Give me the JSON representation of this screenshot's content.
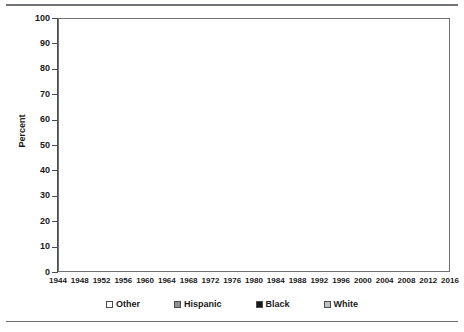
{
  "chart_data": {
    "type": "area",
    "stacked": true,
    "title": "",
    "subtitle": "",
    "xlabel": "",
    "ylabel": "Percent",
    "ylim": [
      0,
      100
    ],
    "ytick_step": 10,
    "yticks": [
      0,
      10,
      20,
      30,
      40,
      50,
      60,
      70,
      80,
      90,
      100
    ],
    "xlim": [
      1944,
      2016
    ],
    "grid": false,
    "legend_position": "bottom",
    "categories": [
      1944,
      1948,
      1952,
      1956,
      1960,
      1964,
      1968,
      1972,
      1976,
      1980,
      1984,
      1988,
      1992,
      1996,
      2000,
      2004,
      2008,
      2012,
      2016
    ],
    "xtick_labels": [
      "1944",
      "1948",
      "1952",
      "1956",
      "1960",
      "1964",
      "1968",
      "1972",
      "1976",
      "1980",
      "1984",
      "1988",
      "1992",
      "1996",
      "2000",
      "2004",
      "2008",
      "2012",
      "2016"
    ],
    "series": [
      {
        "name": "White",
        "color": "#c0c0c0",
        "stack_order": 1,
        "values": [
          88.5,
          88.3,
          88.0,
          87.6,
          87.2,
          86.6,
          85.8,
          84.8,
          83.6,
          82.2,
          80.3,
          78.2,
          75.8,
          73.0,
          70.0,
          66.8,
          63.2,
          58.0,
          50.0
        ]
      },
      {
        "name": "Black",
        "color": "#191919",
        "stack_order": 2,
        "values": [
          5.0,
          5.2,
          5.4,
          5.6,
          5.9,
          6.2,
          6.6,
          7.0,
          7.4,
          7.8,
          8.4,
          8.8,
          9.3,
          9.7,
          10.2,
          10.8,
          11.6,
          13.0,
          16.0
        ]
      },
      {
        "name": "Hispanic",
        "color": "#8f8f8f",
        "stack_order": 3,
        "values": [
          3.0,
          3.1,
          3.2,
          3.3,
          3.5,
          3.7,
          4.0,
          4.4,
          4.8,
          5.3,
          6.1,
          7.0,
          8.2,
          9.6,
          11.3,
          13.2,
          15.4,
          19.0,
          27.5
        ]
      },
      {
        "name": "Other",
        "color": "#ffffff",
        "stack_order": 4,
        "values": [
          3.5,
          3.4,
          3.4,
          3.5,
          3.4,
          3.5,
          3.6,
          3.8,
          4.2,
          4.7,
          5.2,
          6.0,
          6.7,
          7.7,
          8.5,
          9.2,
          9.8,
          10.0,
          6.5
        ]
      }
    ],
    "cumulative_tops": {
      "White": [
        88.5,
        88.3,
        88.0,
        87.6,
        87.2,
        86.6,
        85.8,
        84.8,
        83.6,
        82.2,
        80.3,
        78.2,
        75.8,
        73.0,
        70.0,
        66.8,
        63.2,
        58.0,
        50.0
      ],
      "Black": [
        93.5,
        93.5,
        93.4,
        93.2,
        93.1,
        92.8,
        92.4,
        91.8,
        91.0,
        90.0,
        88.7,
        87.0,
        85.1,
        82.7,
        80.2,
        77.6,
        74.8,
        71.0,
        66.0
      ],
      "Hispanic": [
        96.5,
        96.6,
        96.6,
        96.5,
        96.6,
        96.5,
        96.4,
        96.2,
        95.8,
        95.3,
        94.8,
        94.0,
        93.3,
        92.3,
        91.5,
        90.8,
        90.2,
        90.0,
        93.5
      ],
      "Other": [
        100,
        100,
        100,
        100,
        100,
        100,
        100,
        100,
        100,
        100,
        100,
        100,
        100,
        100,
        100,
        100,
        100,
        100,
        100
      ]
    },
    "legend_entries": [
      {
        "label": "Other",
        "swatch": "#ffffff"
      },
      {
        "label": "Hispanic",
        "swatch": "#8f8f8f"
      },
      {
        "label": "Black",
        "swatch": "#191919"
      },
      {
        "label": "White",
        "swatch": "#c0c0c0"
      }
    ]
  },
  "colors": {
    "frame": "#6e7174",
    "rule": "#6f7276",
    "text": "#1a1a1a",
    "plot_background": "#ffffff"
  }
}
